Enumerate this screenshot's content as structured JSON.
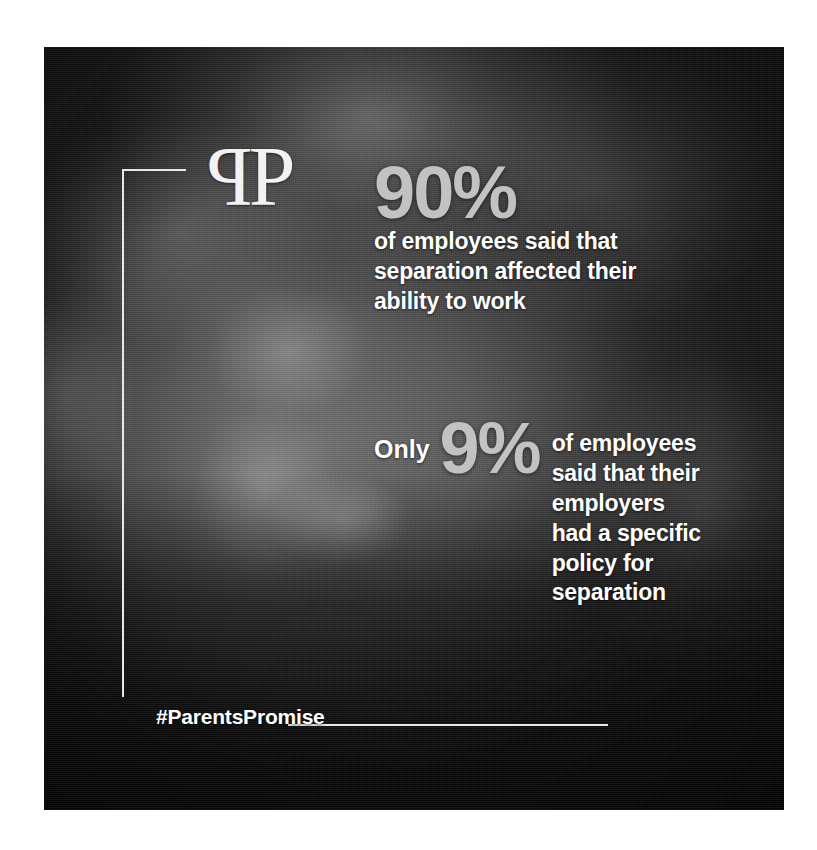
{
  "poster": {
    "brand": {
      "logo_mirror_letter": "P",
      "logo_letter": "P",
      "logo_name": "pp-monogram"
    },
    "photo": {
      "alt": "grayscale photograph of a smiling young child with curly hair",
      "tone": "#3c3c3c"
    },
    "stats": [
      {
        "id": "stat-ninety",
        "prefix": "",
        "number": "90%",
        "lines": [
          "of employees said that",
          "separation affected their",
          "ability to work"
        ]
      },
      {
        "id": "stat-nine",
        "prefix": "Only",
        "number": "9%",
        "lines": [
          "of employees",
          "said that their",
          "employers",
          "had a specific",
          "policy for",
          "separation"
        ]
      }
    ],
    "hashtag": "#ParentsPromise",
    "colors": {
      "number_gray": "#c2c2c2",
      "body_white": "#ffffff",
      "rule_white": "#e8e8e8",
      "page_background": "#ffffff"
    }
  }
}
